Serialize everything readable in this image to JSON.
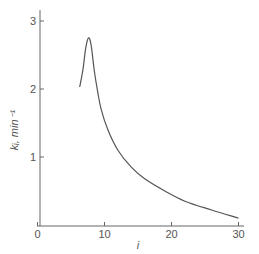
{
  "chart_data": {
    "type": "line",
    "title": "",
    "xlabel": "i",
    "ylabel": "k_i, min^-1",
    "ylabel_display": "kᵢ, min⁻¹",
    "xlim": [
      0,
      31
    ],
    "ylim": [
      0,
      3.2
    ],
    "x_ticks": [
      0,
      10,
      20,
      30
    ],
    "y_ticks": [
      1,
      2,
      3
    ],
    "x_tick_labels": [
      "0",
      "10",
      "20",
      "30"
    ],
    "y_tick_labels": [
      "1",
      "2",
      "3"
    ],
    "grid": false,
    "legend": null,
    "series": [
      {
        "name": "k_i",
        "x": [
          6.3,
          6.8,
          7.2,
          7.6,
          8.0,
          8.5,
          9.0,
          9.5,
          10.5,
          12.0,
          14.0,
          16.0,
          19.0,
          22.0,
          26.0,
          30.0
        ],
        "y": [
          2.03,
          2.3,
          2.6,
          2.75,
          2.65,
          2.25,
          1.95,
          1.7,
          1.4,
          1.1,
          0.85,
          0.68,
          0.5,
          0.35,
          0.22,
          0.1
        ]
      }
    ]
  }
}
